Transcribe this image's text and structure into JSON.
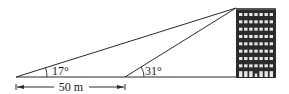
{
  "diagram": {
    "type": "trigonometry-elevation-problem",
    "labels": {
      "angle1": "17°",
      "angle2": "31°",
      "distance": "50 m"
    },
    "geometry": {
      "ground_y": 77,
      "point_a_x": 16,
      "point_b_x": 125,
      "top_x": 236,
      "top_y": 8,
      "building": {
        "x": 236,
        "y": 8,
        "width": 40,
        "height": 70,
        "floors": 9,
        "windows_per_floor": 7
      },
      "dimension_arrow_y": 87
    },
    "colors": {
      "line": "#2a2a2a",
      "building": "#2b2b2b",
      "window": "#e6e6e6",
      "background": "#ffffff"
    }
  }
}
